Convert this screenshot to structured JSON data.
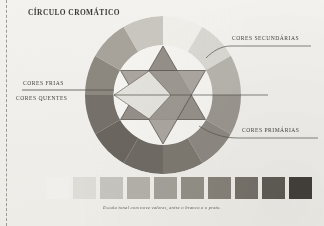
{
  "page": {
    "title": "CÍRCULO CROMÁTICO",
    "caption": "Escala tonal com nove valores, entre o branco e o preto.",
    "paper_color": "#f1efeb",
    "ink_color": "#45423e"
  },
  "labels": {
    "secondary": "CORES SECUNDÁRIAS",
    "primary": "CORES PRIMÁRIAS",
    "cool": "CORES FRIAS",
    "warm": "CORES QUENTES"
  },
  "chart_data": {
    "type": "pie",
    "title": "CÍRCULO CROMÁTICO",
    "subtitle": "",
    "xlabel": "",
    "ylabel": "",
    "legend_position": "right",
    "grid": false,
    "ring": {
      "segments": 12,
      "start_angle_deg": -90,
      "categories": [
        "amarelo",
        "amarelo-alaranjado",
        "laranja",
        "vermelho-alaranjado",
        "vermelho",
        "vermelho-violeta",
        "violeta",
        "azul-violeta",
        "azul",
        "azul-esverdeado",
        "verde",
        "verde-amarelado"
      ],
      "values": [
        30,
        30,
        30,
        30,
        30,
        30,
        30,
        30,
        30,
        30,
        30,
        30
      ],
      "grays": [
        "#efeee9",
        "#d9d7d1",
        "#b6b3ac",
        "#9a968f",
        "#8d8982",
        "#7d7971",
        "#6f6b64",
        "#6a665f",
        "#75716a",
        "#8c887f",
        "#a7a39b",
        "#c9c6bf"
      ]
    },
    "triangles": {
      "primary": {
        "name": "Cores primárias",
        "vertices_deg": [
          -90,
          30,
          150
        ],
        "fill": "#8b8780"
      },
      "secondary": {
        "name": "Cores secundárias",
        "vertices_deg": [
          90,
          -30,
          210
        ],
        "fill": "#9d9992"
      }
    },
    "tonal_scale": {
      "title": "Escala tonal",
      "steps": 10,
      "values": [
        0,
        11,
        22,
        33,
        44,
        56,
        67,
        78,
        89,
        100
      ],
      "grays": [
        "#f0efec",
        "#dedcd7",
        "#c6c4be",
        "#b3b0a9",
        "#a4a199",
        "#928f87",
        "#868279",
        "#76726a",
        "#5f5b55",
        "#43403b"
      ]
    }
  }
}
